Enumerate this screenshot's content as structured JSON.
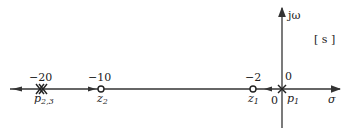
{
  "diagram": {
    "plane_label": "[ s ]",
    "axes": {
      "real_label": "σ",
      "imag_label": "jω",
      "origin_label": "0"
    },
    "poles": [
      {
        "name": "p",
        "sub": "1",
        "value": "0",
        "x": 282,
        "multiplicity": 1
      },
      {
        "name": "p",
        "sub": "2,3",
        "value": "−20",
        "x": 41,
        "multiplicity": 2
      }
    ],
    "zeros": [
      {
        "name": "z",
        "sub": "1",
        "value": "−2",
        "x": 253
      },
      {
        "name": "z",
        "sub": "2",
        "value": "−10",
        "x": 101
      }
    ],
    "colors": {
      "line": "#333333",
      "text": "#222222",
      "background": "#ffffff"
    }
  }
}
